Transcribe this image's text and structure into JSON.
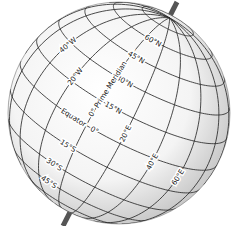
{
  "diagram": {
    "colors": {
      "background": "#ffffff",
      "globe_fill_center": "#ffffff",
      "globe_fill_edge": "#c9c9c9",
      "grid_line": "#2a2a2a",
      "axis_rod": "#555555",
      "label_text": "#222222"
    },
    "geometry": {
      "center_x": 119,
      "center_y": 113,
      "radius": 111,
      "axis_tilt_deg": 28,
      "view_lat_deg": 14,
      "view_lon_deg": 12,
      "axis_top": [
        177,
        2
      ],
      "axis_bottom": [
        63,
        226
      ]
    },
    "grid": {
      "latitudes": [
        -75,
        -60,
        -45,
        -30,
        -15,
        0,
        15,
        30,
        45,
        60,
        75
      ],
      "longitudes": [
        -100,
        -80,
        -60,
        -40,
        -20,
        0,
        20,
        40,
        60,
        80,
        100
      ]
    },
    "labels": {
      "latitude": [
        {
          "text": "60°N",
          "lat": 60,
          "lon": 8
        },
        {
          "text": "45°N",
          "lat": 45,
          "lon": 4
        },
        {
          "text": "30°N",
          "lat": 30,
          "lon": 6
        },
        {
          "text": "15°N",
          "lat": 15,
          "lon": 8
        },
        {
          "text": "0°",
          "lat": 0,
          "lon": 5
        },
        {
          "text": "Equator",
          "lat": 0,
          "lon": -8
        },
        {
          "text": "15°S",
          "lat": -15,
          "lon": -4
        },
        {
          "text": "30°S",
          "lat": -30,
          "lon": -8
        },
        {
          "text": "45°S",
          "lat": -45,
          "lon": -10
        }
      ],
      "longitude": [
        {
          "text": "40°W",
          "lon": -40,
          "lat": 28
        },
        {
          "text": "20°W",
          "lon": -20,
          "lat": 18
        },
        {
          "text": "0° Prime Meridian",
          "lon": 0,
          "lat": 22
        },
        {
          "text": "20°E",
          "lon": 20,
          "lat": 6
        },
        {
          "text": "40°E",
          "lon": 40,
          "lat": -2
        },
        {
          "text": "60°E",
          "lon": 60,
          "lat": -6
        }
      ]
    }
  }
}
